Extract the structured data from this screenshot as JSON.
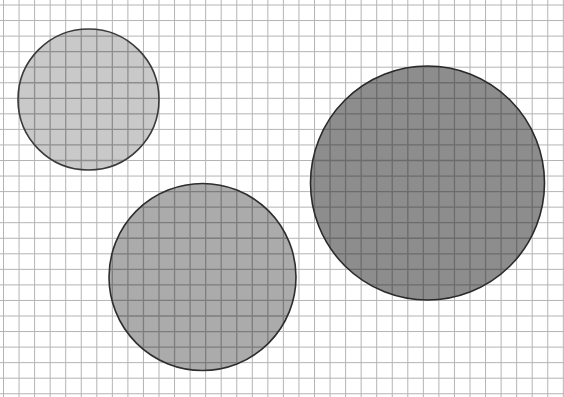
{
  "figure": {
    "background_color": "#ffffff",
    "grid": {
      "origin_x": 3.5,
      "origin_y": 5,
      "spacing": 15.55,
      "line_color": "#b4b4b4",
      "line_width": 1
    },
    "circles": [
      {
        "name": "small-circle",
        "cx": 88.5,
        "cy": 99.5,
        "r": 70.5,
        "fill": "#c9c9c9",
        "inner_grid_color": "#8e8e8e",
        "stroke": "#3a3a3a",
        "shade": "light"
      },
      {
        "name": "medium-circle",
        "cx": 202.5,
        "cy": 277,
        "r": 93.5,
        "fill": "#ababab",
        "inner_grid_color": "#7d7d7d",
        "stroke": "#2e2e2e",
        "shade": "medium"
      },
      {
        "name": "large-circle",
        "cx": 427.5,
        "cy": 183,
        "r": 117,
        "fill": "#8d8d8d",
        "inner_grid_color": "#6c6c6c",
        "stroke": "#2a2a2a",
        "shade": "dark"
      }
    ]
  }
}
